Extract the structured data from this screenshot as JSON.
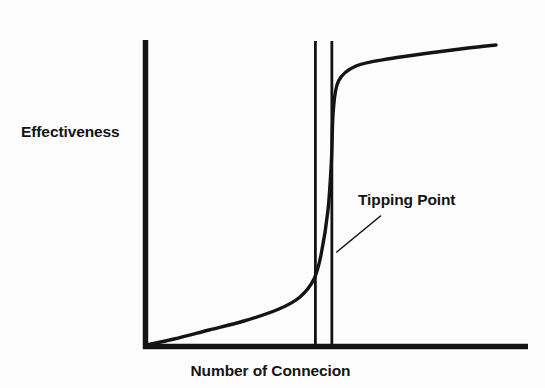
{
  "chart_data": {
    "type": "line",
    "title": "",
    "subtitle": "",
    "xlabel": "Number of Connecion",
    "ylabel": "Effectiveness",
    "xlim": [
      0,
      1
    ],
    "ylim": [
      0,
      1
    ],
    "grid": false,
    "legend": "none",
    "axis_ticks": {
      "x": [],
      "y": []
    },
    "series": [
      {
        "name": "Effectiveness curve",
        "shape": "sigmoid",
        "description": "S-curve rising slowly, then sharply at the tipping point, then plateauing",
        "points": [
          {
            "x": 0.0,
            "y": 0.0
          },
          {
            "x": 0.08,
            "y": 0.02
          },
          {
            "x": 0.18,
            "y": 0.05
          },
          {
            "x": 0.28,
            "y": 0.08
          },
          {
            "x": 0.38,
            "y": 0.12
          },
          {
            "x": 0.44,
            "y": 0.16
          },
          {
            "x": 0.48,
            "y": 0.22
          },
          {
            "x": 0.5,
            "y": 0.3
          },
          {
            "x": 0.52,
            "y": 0.45
          },
          {
            "x": 0.53,
            "y": 0.62
          },
          {
            "x": 0.535,
            "y": 0.78
          },
          {
            "x": 0.55,
            "y": 0.88
          },
          {
            "x": 0.6,
            "y": 0.93
          },
          {
            "x": 0.7,
            "y": 0.955
          },
          {
            "x": 0.82,
            "y": 0.975
          },
          {
            "x": 0.92,
            "y": 0.99
          },
          {
            "x": 1.0,
            "y": 1.0
          }
        ]
      }
    ],
    "vertical_markers": [
      {
        "name": "tipping-band-left",
        "x": 0.484
      },
      {
        "name": "tipping-band-right",
        "x": 0.531
      }
    ],
    "annotations": [
      {
        "name": "tipping-point",
        "text": "Tipping Point",
        "leader_from": {
          "x": 0.545,
          "y": 0.31
        },
        "leader_to": {
          "x": 0.67,
          "y": 0.43
        }
      }
    ],
    "colors": {
      "background": "#fdfdfd",
      "axis": "#141414",
      "curve": "#141414",
      "marker_line": "#141414",
      "text": "#141414"
    }
  },
  "labels": {
    "y_axis": "Effectiveness",
    "x_axis": "Number of Connecion",
    "annotation": "Tipping Point"
  }
}
